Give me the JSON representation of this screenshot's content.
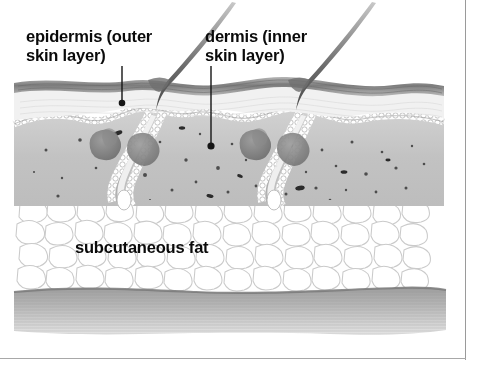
{
  "figure": {
    "type": "anatomical-illustration",
    "medium": "grayscale pen-and-ink / wash drawing"
  },
  "labels": {
    "epidermis": "epidermis (outer\nskin layer)",
    "dermis": "dermis (inner\nskin layer)",
    "subcutaneous_fat": "subcutaneous fat"
  },
  "leader_lines": [
    {
      "name": "epidermis-leader",
      "from_x": 122,
      "from_y": 66,
      "to_x": 122,
      "to_y": 101,
      "dot_x": 122,
      "dot_y": 103
    },
    {
      "name": "dermis-leader",
      "from_x": 211,
      "from_y": 66,
      "to_x": 211,
      "to_y": 143,
      "dot_x": 211,
      "dot_y": 146
    }
  ],
  "structures": [
    {
      "name": "hair-shaft-left",
      "emerges_at_x": 160,
      "tip_x": 232,
      "tip_y": 2
    },
    {
      "name": "hair-shaft-right",
      "emerges_at_x": 310,
      "tip_x": 372,
      "tip_y": 2
    },
    {
      "name": "hair-follicle-left"
    },
    {
      "name": "hair-follicle-right"
    },
    {
      "name": "sebaceous-gland-left"
    },
    {
      "name": "sebaceous-gland-right"
    },
    {
      "name": "epidermis-surface-band"
    },
    {
      "name": "basal-cell-layer"
    },
    {
      "name": "dermis-body"
    },
    {
      "name": "subcutaneous-fat-cells"
    },
    {
      "name": "muscle-fascia-layer"
    }
  ],
  "colors": {
    "background": "#ffffff",
    "ink": "#0a0a0a",
    "epidermis_band": "#8e8e8e",
    "dermis_fill": "#c6c6c6",
    "dermis_speckle": "#3a3a3a",
    "fat_outline": "#c9c9c9",
    "fat_fill": "#ffffff",
    "muscle_layer": "#b4b4b4",
    "frame_rule": "#9a9a9a",
    "leader_line": "#1a1a1a"
  }
}
